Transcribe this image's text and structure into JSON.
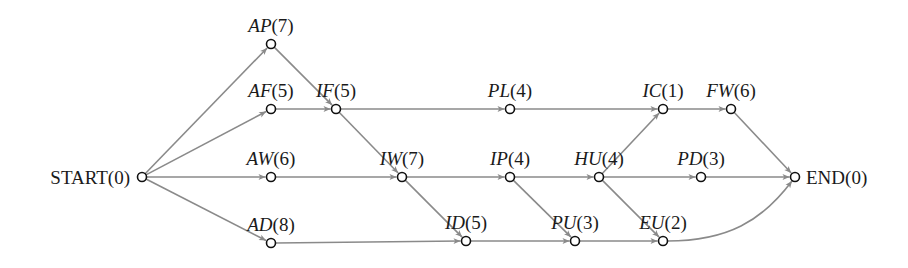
{
  "diagram": {
    "type": "activity-on-node network",
    "colors": {
      "edge": "#8a8a8a",
      "node_stroke": "#111111",
      "text": "#1a1a1a"
    },
    "nodes": [
      {
        "id": "START",
        "name": "START",
        "duration": "(0)",
        "x": 142,
        "y": 177,
        "italic": false,
        "label_pos": "left"
      },
      {
        "id": "AP",
        "name": "AP",
        "duration": "(7)",
        "x": 271,
        "y": 44,
        "italic": true,
        "label_pos": "above"
      },
      {
        "id": "AF",
        "name": "AF",
        "duration": "(5)",
        "x": 271,
        "y": 109,
        "italic": true,
        "label_pos": "above"
      },
      {
        "id": "AW",
        "name": "AW",
        "duration": "(6)",
        "x": 271,
        "y": 177,
        "italic": true,
        "label_pos": "above"
      },
      {
        "id": "AD",
        "name": "AD",
        "duration": "(8)",
        "x": 271,
        "y": 243,
        "italic": true,
        "label_pos": "above"
      },
      {
        "id": "IF",
        "name": "IF",
        "duration": "(5)",
        "x": 336,
        "y": 109,
        "italic": true,
        "label_pos": "above"
      },
      {
        "id": "PL",
        "name": "PL",
        "duration": "(4)",
        "x": 510,
        "y": 109,
        "italic": true,
        "label_pos": "above"
      },
      {
        "id": "IC",
        "name": "IC",
        "duration": "(1)",
        "x": 663,
        "y": 109,
        "italic": true,
        "label_pos": "above"
      },
      {
        "id": "FW",
        "name": "FW",
        "duration": "(6)",
        "x": 731,
        "y": 109,
        "italic": true,
        "label_pos": "above"
      },
      {
        "id": "IW",
        "name": "IW",
        "duration": "(7)",
        "x": 402,
        "y": 177,
        "italic": true,
        "label_pos": "above"
      },
      {
        "id": "IP",
        "name": "IP",
        "duration": "(4)",
        "x": 510,
        "y": 177,
        "italic": true,
        "label_pos": "above"
      },
      {
        "id": "HU",
        "name": "HU",
        "duration": "(4)",
        "x": 599,
        "y": 177,
        "italic": true,
        "label_pos": "above"
      },
      {
        "id": "PD",
        "name": "PD",
        "duration": "(3)",
        "x": 701,
        "y": 177,
        "italic": true,
        "label_pos": "above"
      },
      {
        "id": "END",
        "name": "END",
        "duration": "(0)",
        "x": 795,
        "y": 177,
        "italic": false,
        "label_pos": "right"
      },
      {
        "id": "ID",
        "name": "ID",
        "duration": "(5)",
        "x": 466,
        "y": 241,
        "italic": true,
        "label_pos": "above"
      },
      {
        "id": "PU",
        "name": "PU",
        "duration": "(3)",
        "x": 575,
        "y": 241,
        "italic": true,
        "label_pos": "above"
      },
      {
        "id": "EU",
        "name": "EU",
        "duration": "(2)",
        "x": 663,
        "y": 241,
        "italic": true,
        "label_pos": "above"
      }
    ],
    "edges": [
      {
        "from": "START",
        "to": "AP"
      },
      {
        "from": "START",
        "to": "AF"
      },
      {
        "from": "START",
        "to": "AW"
      },
      {
        "from": "START",
        "to": "AD"
      },
      {
        "from": "AP",
        "to": "IF"
      },
      {
        "from": "AF",
        "to": "IF"
      },
      {
        "from": "IF",
        "to": "PL"
      },
      {
        "from": "IF",
        "to": "IW"
      },
      {
        "from": "AW",
        "to": "IW"
      },
      {
        "from": "PL",
        "to": "IC"
      },
      {
        "from": "IC",
        "to": "FW"
      },
      {
        "from": "FW",
        "to": "END"
      },
      {
        "from": "IW",
        "to": "IP"
      },
      {
        "from": "IW",
        "to": "ID"
      },
      {
        "from": "IP",
        "to": "HU"
      },
      {
        "from": "IP",
        "to": "PU"
      },
      {
        "from": "HU",
        "to": "IC"
      },
      {
        "from": "HU",
        "to": "PD"
      },
      {
        "from": "HU",
        "to": "EU"
      },
      {
        "from": "PD",
        "to": "END"
      },
      {
        "from": "AD",
        "to": "ID"
      },
      {
        "from": "ID",
        "to": "PU"
      },
      {
        "from": "PU",
        "to": "EU"
      },
      {
        "from": "EU",
        "to": "END",
        "curved": true
      }
    ]
  }
}
